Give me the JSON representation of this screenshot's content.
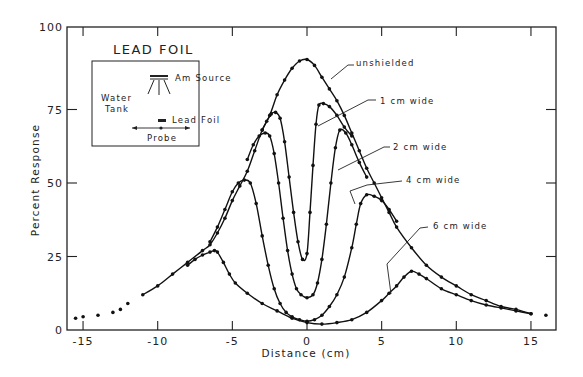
{
  "chart_data": {
    "type": "line",
    "title": "LEAD FOIL",
    "xlabel": "Distance (cm)",
    "ylabel": "Percent Response",
    "xlim": [
      -16.2,
      16.5
    ],
    "ylim": [
      0,
      100
    ],
    "x_ticks": [
      -15,
      -10,
      -5,
      0,
      5,
      10,
      15
    ],
    "x_tick_labels": [
      "-15",
      "-10",
      "-5",
      "0",
      "5",
      "10",
      "15"
    ],
    "y_ticks": [
      0,
      25,
      50,
      75,
      100
    ],
    "y_tick_labels": [
      "0",
      "25",
      "50",
      "75",
      "100"
    ],
    "grid": false,
    "legend": "none (curves labeled directly)",
    "inset": {
      "labels": {
        "source": "Am Source",
        "tank": [
          "Water",
          "Tank"
        ],
        "foil": "Lead Foil",
        "probe": "Probe"
      }
    },
    "series": [
      {
        "name": "unshielded",
        "label": "unshielded",
        "x": [
          -15.5,
          -15,
          -14,
          -13,
          -12.5,
          -12,
          -11,
          -10,
          -9,
          -8,
          -7,
          -6.5,
          -6,
          -5.5,
          -5,
          -4.5,
          -4,
          -3.5,
          -3,
          -2.5,
          -2,
          -1.5,
          -1,
          -0.5,
          0,
          0.5,
          1,
          1.5,
          2,
          2.5,
          3,
          3.5,
          4,
          4.5,
          5,
          5.5,
          6,
          7,
          8,
          9,
          10,
          11,
          12,
          13,
          14,
          15,
          16
        ],
        "values": [
          4,
          4.5,
          5,
          6,
          7,
          9,
          12,
          15,
          19,
          23,
          27,
          29,
          33,
          38,
          44,
          49,
          54,
          61,
          68,
          73,
          80,
          85,
          89,
          91.5,
          92,
          90,
          86,
          82,
          78,
          73,
          67,
          61,
          55,
          50,
          45,
          40,
          35,
          28,
          22,
          18,
          15,
          12,
          10,
          8,
          7,
          5.5,
          5
        ]
      },
      {
        "name": "1 cm wide",
        "label": "1 cm wide",
        "x": [
          -3,
          -2.7,
          -2.4,
          -2.1,
          -1.8,
          -1.5,
          -1.2,
          -0.9,
          -0.6,
          -0.3,
          0,
          0.2,
          0.4,
          0.6,
          0.8,
          1.1,
          1.5,
          2,
          2.5,
          3
        ],
        "values": [
          68,
          71,
          73.5,
          74,
          72,
          64,
          52,
          40,
          30,
          24,
          26,
          40,
          56,
          70,
          76.5,
          77,
          76,
          73,
          69,
          66
        ]
      },
      {
        "name": "2 cm wide",
        "label": "2 cm wide",
        "x": [
          -4,
          -3.6,
          -3.2,
          -2.8,
          -2.5,
          -2.2,
          -1.9,
          -1.6,
          -1.3,
          -1,
          -0.7,
          -0.4,
          0,
          0.4,
          0.7,
          1,
          1.3,
          1.6,
          1.9,
          2.2,
          2.6,
          3,
          3.5,
          4
        ],
        "values": [
          58,
          63,
          66,
          67,
          66,
          60,
          50,
          38,
          27,
          19,
          14,
          12,
          11,
          12,
          16,
          24,
          36,
          50,
          62,
          68,
          67,
          63,
          57,
          52
        ]
      },
      {
        "name": "4 cm wide",
        "label": "4 cm wide",
        "x": [
          -6.5,
          -6,
          -5.5,
          -5,
          -4.6,
          -4.2,
          -3.8,
          -3.4,
          -3,
          -2.6,
          -2.2,
          -1.8,
          -1.4,
          -1,
          -0.5,
          0,
          0.5,
          1,
          1.5,
          2,
          2.5,
          3,
          3.3,
          3.6,
          4,
          4.5,
          5,
          5.5,
          6
        ],
        "values": [
          30,
          35,
          41,
          47,
          50,
          51,
          50,
          43,
          32,
          22,
          14,
          9,
          6,
          4.5,
          3.5,
          3,
          3.5,
          5,
          8,
          12,
          18,
          28,
          36,
          43,
          46,
          45.5,
          44,
          41,
          37
        ]
      },
      {
        "name": "6 cm wide",
        "label": "6 cm wide",
        "x": [
          -8,
          -7.5,
          -7,
          -6.5,
          -6.2,
          -6,
          -5.6,
          -5.2,
          -4.8,
          -4,
          -3,
          -2,
          -1,
          0,
          1,
          2,
          3,
          4,
          5,
          5.5,
          6,
          6.5,
          7,
          7.5,
          8,
          9,
          10,
          11,
          12,
          13,
          14,
          15
        ],
        "values": [
          22,
          24,
          25.5,
          26.5,
          27,
          26.5,
          23,
          19,
          16,
          12.5,
          9,
          6.5,
          4,
          2.5,
          2,
          2.5,
          3.5,
          6,
          10,
          12.5,
          15,
          18,
          20,
          19,
          17.5,
          14,
          12,
          10,
          8.5,
          7.5,
          6.5,
          5.5
        ]
      }
    ]
  }
}
